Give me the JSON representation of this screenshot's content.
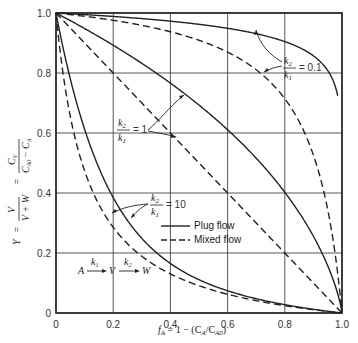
{
  "chart_data": {
    "type": "line",
    "title": "",
    "xlabel": "f_A = 1 − (C_A/C_A0)",
    "ylabel": "Y = V/(V+W) = C_V/(C_A0 − C_A)",
    "xlim": [
      0,
      1.0
    ],
    "ylim": [
      0,
      1.0
    ],
    "xticks": [
      "0",
      "0.2",
      "0.4",
      "0.6",
      "0.8",
      "1.0"
    ],
    "yticks": [
      "0",
      "0.2",
      "0.4",
      "0.6",
      "0.8",
      "1.0"
    ],
    "grid": true,
    "legend": {
      "position": "lower-middle",
      "entries": [
        {
          "label": "Plug flow",
          "style": "solid"
        },
        {
          "label": "Mixed flow",
          "style": "dashed"
        }
      ]
    },
    "reaction_scheme": {
      "from": "A",
      "mid": "V",
      "to": "W",
      "k_first": "k1",
      "k_second": "k2"
    },
    "annotations": [
      {
        "text": "k2/k1 = 0.1",
        "ratio": 0.1
      },
      {
        "text": "k2/k1 = 1",
        "ratio": 1
      },
      {
        "text": "k2/k1 = 10",
        "ratio": 10
      }
    ],
    "x": [
      0,
      0.1,
      0.2,
      0.3,
      0.4,
      0.5,
      0.6,
      0.7,
      0.8,
      0.9,
      0.95,
      1.0
    ],
    "series": [
      {
        "name": "Plug flow, k2/k1 = 0.1",
        "style": "solid",
        "ratio": 0.1,
        "values": [
          1.0,
          0.995,
          0.989,
          0.982,
          0.975,
          0.966,
          0.955,
          0.94,
          0.92,
          0.881,
          0.845,
          0.74
        ]
      },
      {
        "name": "Mixed flow, k2/k1 = 0.1",
        "style": "dashed",
        "ratio": 0.1,
        "values": [
          1.0,
          0.989,
          0.976,
          0.959,
          0.938,
          0.909,
          0.87,
          0.811,
          0.714,
          0.526,
          0.345,
          0.0
        ]
      },
      {
        "name": "Plug flow, k2/k1 = 1",
        "style": "solid",
        "ratio": 1,
        "values": [
          1.0,
          0.948,
          0.893,
          0.832,
          0.766,
          0.693,
          0.611,
          0.516,
          0.402,
          0.256,
          0.158,
          0.0
        ]
      },
      {
        "name": "Mixed flow, k2/k1 = 1",
        "style": "dashed",
        "ratio": 1,
        "values": [
          1.0,
          0.9,
          0.8,
          0.7,
          0.6,
          0.5,
          0.4,
          0.3,
          0.2,
          0.1,
          0.05,
          0.0
        ]
      },
      {
        "name": "Plug flow, k2/k1 = 10",
        "style": "solid",
        "ratio": 10,
        "values": [
          1.0,
          0.723,
          0.557,
          0.453,
          0.37,
          0.301,
          0.244,
          0.19,
          0.139,
          0.082,
          0.053,
          0.0
        ]
      },
      {
        "name": "Mixed flow, k2/k1 = 10",
        "style": "dashed",
        "ratio": 10,
        "values": [
          1.0,
          0.474,
          0.286,
          0.189,
          0.13,
          0.091,
          0.063,
          0.041,
          0.024,
          0.011,
          0.005,
          0.0
        ]
      }
    ]
  },
  "labels": {
    "x_axis": "f",
    "x_axis_sub": "A",
    "x_axis_rest": " = 1 − (C",
    "x_axis_sub2": "A",
    "x_axis_slash": "/C",
    "x_axis_sub3": "A0",
    "x_axis_close": ")",
    "legend_plug": "Plug flow",
    "legend_mixed": "Mixed flow",
    "ann_k2": "k",
    "ann_k1": "k",
    "ann_eq_01": "= 0.1",
    "ann_eq_1": "= 1",
    "ann_eq_10": "= 10",
    "scheme_A": "A",
    "scheme_V": "V",
    "scheme_W": "W",
    "scheme_k1": "k",
    "scheme_k2": "k"
  }
}
